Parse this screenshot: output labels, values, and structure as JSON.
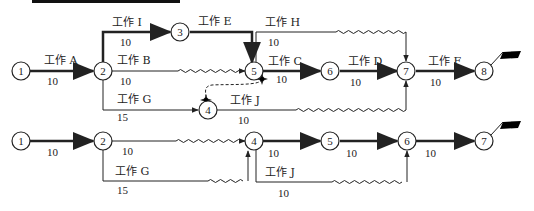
{
  "top_network": {
    "nodes": [
      "1",
      "2",
      "3",
      "4",
      "5",
      "6",
      "7",
      "8"
    ],
    "activities": {
      "A": {
        "label": "工作 A",
        "duration": "10"
      },
      "I": {
        "label": "工作 I",
        "duration": "10"
      },
      "E": {
        "label": "工作 E"
      },
      "H": {
        "label": "工作 H",
        "duration": "10"
      },
      "B": {
        "label": "工作 B",
        "duration": "10"
      },
      "C": {
        "label": "工作 C",
        "duration": "10"
      },
      "D": {
        "label": "工作 D",
        "duration": "10"
      },
      "F": {
        "label": "工作 F",
        "duration": "10"
      },
      "G": {
        "label": "工作 G",
        "duration": "15"
      },
      "J": {
        "label": "工作 J",
        "duration": "10"
      }
    }
  },
  "bottom_network": {
    "nodes": [
      "1",
      "2",
      "4",
      "5",
      "6",
      "7"
    ],
    "activities": {
      "e12": {
        "duration": "10"
      },
      "e24": {
        "duration": "10"
      },
      "G": {
        "label": "工作 G",
        "duration": "15"
      },
      "e45": {
        "duration": "10"
      },
      "e56": {
        "duration": "10"
      },
      "J": {
        "label": "工作 J",
        "duration": "10"
      },
      "e67": {
        "duration": "10"
      }
    }
  },
  "colors": {
    "line": "#222222",
    "node_fill": "#ffffff",
    "flag": "#000000"
  }
}
